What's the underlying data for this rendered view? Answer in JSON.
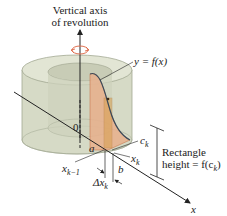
{
  "title": {
    "line1": "Vertical axis",
    "line2": "of revolution"
  },
  "icons": {
    "rotation": "rotation-arrow-icon"
  },
  "labels": {
    "curve": "y = f(x)",
    "origin": "0",
    "a": "a",
    "b": "b",
    "ck_main": "c",
    "ck_sub": "k",
    "xk_main": "x",
    "xk_sub": "k",
    "xk1_main": "x",
    "xk1_sub": "k−1",
    "dx_main": "Δx",
    "dx_sub": "k",
    "x_axis": "x",
    "rect_line1": "Rectangle",
    "rect_line2_prefix": "height = f(c",
    "rect_line2_sub": "k",
    "rect_line2_suffix": ")"
  },
  "colors": {
    "solid_outer": "#d9dccb",
    "solid_inner": "#c4c8b2",
    "solid_edge": "#9aa08a",
    "region_fill": "#e8b08c",
    "region_edge": "#c86a3c",
    "rect_fill": "#d8a050",
    "curve": "#3a4a5a",
    "rotation_icon": "#e07050",
    "line": "#222222"
  }
}
